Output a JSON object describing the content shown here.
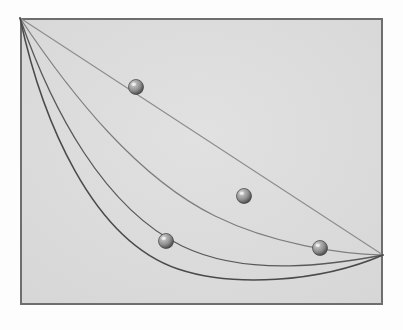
{
  "figure": {
    "canvas": {
      "width": 403,
      "height": 330
    },
    "colors": {
      "page_background": "#fdfdfd",
      "panel_fill": "#dcdcdc",
      "panel_border": "#6e6e6e",
      "curve_dark": "#4a4a4a",
      "curve_mid": "#595959",
      "curve_light": "#7e7e7e",
      "line_straight": "#8c8c8c",
      "sphere_highlight": "#d8d8d8",
      "sphere_mid": "#8f8f8f",
      "sphere_shadow": "#4d4d4d",
      "sphere_outline": "#3f3f3f"
    },
    "panel": {
      "x": 20,
      "y": 18,
      "width": 363,
      "height": 287,
      "border_width": 2
    },
    "origin_point": {
      "x": 20,
      "y": 18
    },
    "endpoint": {
      "x": 383,
      "y": 255
    }
  },
  "paths": [
    {
      "id": "straight-line",
      "label": "Straight line",
      "stroke": "#8c8c8c",
      "stroke_width": 1.1,
      "d": "M 20 18 L 383 255"
    },
    {
      "id": "shallow-curve",
      "label": "Shallow arc",
      "stroke": "#7e7e7e",
      "stroke_width": 1.2,
      "d": "M 20 18 C 72 96 138 178 215 216 C 272 244 340 254 383 255"
    },
    {
      "id": "medium-curve",
      "label": "Intermediate arc",
      "stroke": "#595959",
      "stroke_width": 1.3,
      "d": "M 20 18 C 52 110 104 208 182 246 C 248 278 336 264 383 255"
    },
    {
      "id": "cycloid-curve",
      "label": "Cycloid (brachistochrone)",
      "stroke": "#4a4a4a",
      "stroke_width": 1.5,
      "d": "M 20 18 C 42 120 92 240 178 269 C 232 287 318 283 383 255"
    }
  ],
  "spheres": [
    {
      "id": "sphere-on-straight-line",
      "label": "Ball on straight line",
      "cx": 136,
      "cy": 87,
      "r": 7.5
    },
    {
      "id": "sphere-on-shallow-curve",
      "label": "Ball on shallow arc",
      "cx": 244,
      "cy": 196,
      "r": 7.5
    },
    {
      "id": "sphere-on-cycloid",
      "label": "Ball on cycloid",
      "cx": 166,
      "cy": 241,
      "r": 7.5
    },
    {
      "id": "sphere-on-medium-curve",
      "label": "Ball on intermediate arc",
      "cx": 320,
      "cy": 248,
      "r": 7.5
    }
  ]
}
